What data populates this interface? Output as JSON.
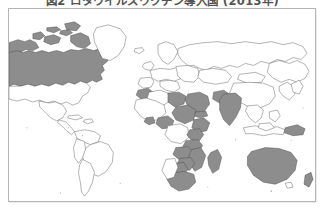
{
  "caption": {
    "text": "図2 ロタウイルスワクチン導入国 (2013年)",
    "clipped": true
  },
  "figure": {
    "frame_border_color": "#b4b4b4",
    "background_color": "#ffffff"
  },
  "map": {
    "type": "choropleth",
    "projection": "equirectangular",
    "highlight_color": "#8d8d8d",
    "plain_color": "#ffffff",
    "border_color": "#555555",
    "highlighted_regions": [
      "Canada",
      "Alaska",
      "Morocco",
      "Libya",
      "Sudan",
      "Ethiopia",
      "Kenya",
      "Tanzania",
      "Zambia",
      "Zimbabwe",
      "Botswana",
      "South Africa",
      "Mozambique",
      "Madagascar",
      "Ghana",
      "Nigeria",
      "Saudi Arabia",
      "Yemen",
      "Pakistan",
      "India",
      "Australia",
      "Papua New Guinea",
      "New Zealand"
    ],
    "plain_regions": [
      "United States",
      "Greenland",
      "Mexico",
      "Brazil",
      "Argentina",
      "Russia",
      "China",
      "Europe",
      "Kazakhstan",
      "Mongolia",
      "Japan",
      "Indonesia"
    ]
  }
}
